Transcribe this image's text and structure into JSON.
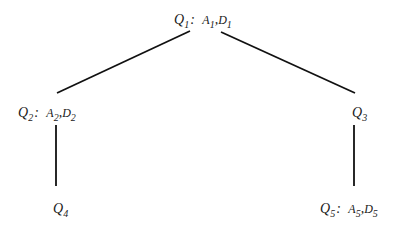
{
  "diagram": {
    "type": "tree",
    "nodes": [
      {
        "id": "Q1",
        "label": "Q",
        "index": "1",
        "annotation": [
          {
            "sym": "A",
            "idx": "1"
          },
          {
            "sym": "D",
            "idx": "1"
          }
        ]
      },
      {
        "id": "Q2",
        "label": "Q",
        "index": "2",
        "annotation": [
          {
            "sym": "A",
            "idx": "2"
          },
          {
            "sym": "D",
            "idx": "2"
          }
        ]
      },
      {
        "id": "Q3",
        "label": "Q",
        "index": "3",
        "annotation": []
      },
      {
        "id": "Q4",
        "label": "Q",
        "index": "4",
        "annotation": []
      },
      {
        "id": "Q5",
        "label": "Q",
        "index": "5",
        "annotation": [
          {
            "sym": "A",
            "idx": "5"
          },
          {
            "sym": "D",
            "idx": "5"
          }
        ]
      }
    ],
    "edges": [
      {
        "from": "Q1",
        "to": "Q2"
      },
      {
        "from": "Q1",
        "to": "Q3"
      },
      {
        "from": "Q2",
        "to": "Q4"
      },
      {
        "from": "Q3",
        "to": "Q5"
      }
    ],
    "colon": ":",
    "comma": ","
  }
}
